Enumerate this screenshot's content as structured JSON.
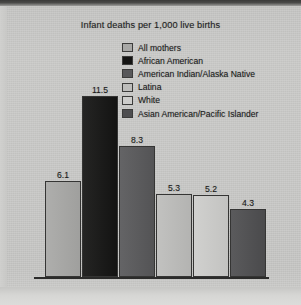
{
  "chart_data": {
    "type": "bar",
    "title": "Infant deaths per 1,000 live births",
    "xlabel": "",
    "ylabel": "",
    "ylim": [
      0,
      12.5
    ],
    "grid": false,
    "legend_position": "top-right",
    "categories": [
      "All mothers",
      "African American",
      "American Indian/Alaska Native",
      "Latina",
      "White",
      "Asian American/Pacific Islander"
    ],
    "values": [
      6.1,
      11.5,
      8.3,
      5.3,
      5.2,
      4.3
    ],
    "value_labels": [
      "6.1",
      "11.5",
      "8.3",
      "5.3",
      "5.2",
      "4.3"
    ],
    "series": [
      {
        "name": "Infant deaths per 1,000 live births",
        "values": [
          6.1,
          11.5,
          8.3,
          5.3,
          5.2,
          4.3
        ]
      }
    ],
    "bar_colors": [
      "#a8a8a6",
      "#141413",
      "#58585a",
      "#bdbdbb",
      "#cdcdcb",
      "#4e4e50"
    ]
  },
  "chart": {
    "title": "Infant deaths per 1,000 live births"
  },
  "legend": {
    "items": [
      {
        "label": "All mothers",
        "color": "#a8a8a6"
      },
      {
        "label": "African American",
        "color": "#141413"
      },
      {
        "label": "American Indian/Alaska Native",
        "color": "#58585a"
      },
      {
        "label": "Latina",
        "color": "#bdbdbb"
      },
      {
        "label": "White",
        "color": "#cdcdcb"
      },
      {
        "label": "Asian American/Pacific Islander",
        "color": "#4e4e50"
      }
    ]
  },
  "bars": [
    {
      "label": "All mothers",
      "value": "6.1",
      "color": "#a8a8a6"
    },
    {
      "label": "African American",
      "value": "11.5",
      "color": "#141413"
    },
    {
      "label": "American Indian/Alaska Native",
      "value": "8.3",
      "color": "#58585a"
    },
    {
      "label": "Latina",
      "value": "5.3",
      "color": "#bdbdbb"
    },
    {
      "label": "White",
      "value": "5.2",
      "color": "#cdcdcb"
    },
    {
      "label": "Asian American/Pacific Islander",
      "value": "4.3",
      "color": "#4e4e50"
    }
  ],
  "colors": {
    "background": "#c9c9c7",
    "axis": "#2b2b2a",
    "text": "#191919"
  }
}
